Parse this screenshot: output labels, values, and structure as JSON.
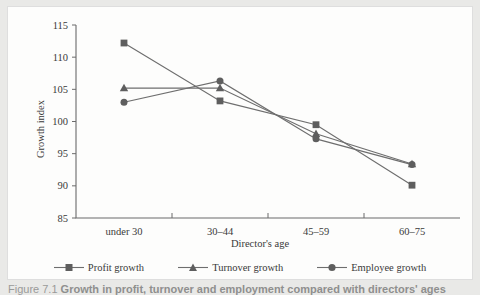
{
  "figure": {
    "caption_label": "Figure 7.1",
    "caption_text": "Growth in profit, turnover and employment compared with directors' ages"
  },
  "chart_data": {
    "type": "line",
    "title": "",
    "xlabel": "Director's age",
    "ylabel": "Growth index",
    "categories": [
      "under 30",
      "30–44",
      "45–59",
      "60–75"
    ],
    "yticks": [
      85,
      90,
      95,
      100,
      105,
      110,
      115
    ],
    "ylim": [
      85,
      115
    ],
    "grid": false,
    "legend_position": "bottom",
    "series": [
      {
        "name": "Profit growth",
        "marker": "square",
        "color": "#5e5e5e",
        "values": [
          112.2,
          103.2,
          99.5,
          90.1
        ]
      },
      {
        "name": "Turnover growth",
        "marker": "triangle",
        "color": "#5e5e5e",
        "values": [
          105.2,
          105.2,
          98.1,
          93.4
        ]
      },
      {
        "name": "Employee growth",
        "marker": "circle",
        "color": "#5e5e5e",
        "values": [
          103.0,
          106.3,
          97.3,
          93.3
        ]
      }
    ]
  }
}
